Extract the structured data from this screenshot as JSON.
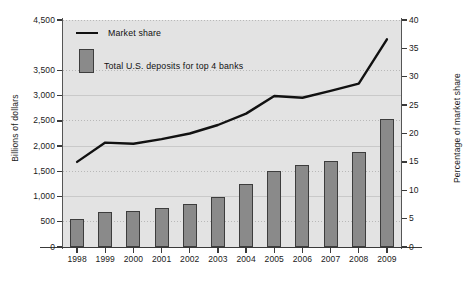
{
  "chart_data": {
    "type": "bar",
    "title": "",
    "xlabel": "",
    "ylabel": "Billions of dollars",
    "y2label": "Percentage of market share",
    "categories": [
      "1998",
      "1999",
      "2000",
      "2001",
      "2002",
      "2003",
      "2004",
      "2005",
      "2006",
      "2007",
      "2008",
      "2009"
    ],
    "ylim": [
      0,
      4500
    ],
    "y2lim": [
      0,
      40
    ],
    "yticks": [
      "0",
      "500",
      "1,000",
      "1,500",
      "2,000",
      "2,500",
      "3,000",
      "3,500",
      "4,500"
    ],
    "ytick_values": [
      0,
      500,
      1000,
      1500,
      2000,
      2500,
      3000,
      3500,
      4500
    ],
    "y2ticks": [
      "0",
      "5",
      "10",
      "15",
      "20",
      "25",
      "30",
      "35",
      "40"
    ],
    "y2tick_values": [
      0,
      5,
      10,
      15,
      20,
      25,
      30,
      35,
      40
    ],
    "grid": true,
    "legend_position": "upper left",
    "series": [
      {
        "name": "Total U.S. deposits for top 4 banks",
        "kind": "bar",
        "axis": "left",
        "unit": "Billions of dollars",
        "color": "#8a8a8a",
        "edge_color": "#3d3d3d",
        "values": [
          555,
          690,
          715,
          770,
          855,
          1000,
          1240,
          1500,
          1620,
          1710,
          1890,
          2540
        ]
      },
      {
        "name": "Market share",
        "kind": "line",
        "axis": "right",
        "unit": "Percentage of market share",
        "color": "#111111",
        "values": [
          15.0,
          18.4,
          18.2,
          19.0,
          20.0,
          21.5,
          23.5,
          26.6,
          26.3,
          27.5,
          28.8,
          36.6
        ]
      }
    ]
  },
  "legend": {
    "line_label": "Market share",
    "bar_label": "Total U.S. deposits for top 4 banks"
  },
  "axes": {
    "left_title": "Billions of dollars",
    "right_title": "Percentage of market share"
  },
  "colors": {
    "plot_background": "#e3e3e3",
    "bar_fill": "#8a8a8a",
    "bar_edge": "#3d3d3d",
    "line": "#111111",
    "axis": "#3a3a3a",
    "grid": "#b8b8b8",
    "text": "#1a1a1a"
  }
}
